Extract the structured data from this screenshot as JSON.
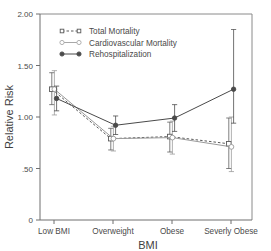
{
  "chart_data": {
    "type": "line",
    "title": "",
    "xlabel": "BMI",
    "ylabel": "Relative Risk",
    "categories": [
      "Low BMI",
      "Overweight",
      "Obese",
      "Severly Obese"
    ],
    "ylim": [
      0,
      2.0
    ],
    "yticks": [
      0,
      0.5,
      1.0,
      1.5,
      2.0
    ],
    "ytick_labels": [
      "0",
      ".50",
      "1.00",
      "1.50",
      "2.00"
    ],
    "grid": false,
    "legend_position": "top-left-inside",
    "series": [
      {
        "name": "Total Mortality",
        "values": [
          1.27,
          0.79,
          0.81,
          0.74
        ],
        "ci_low": [
          1.12,
          0.68,
          0.66,
          0.5
        ],
        "ci_high": [
          1.43,
          0.89,
          0.95,
          0.99
        ],
        "line_style": "dashed",
        "marker": "open-square",
        "color": "#5a5a5a"
      },
      {
        "name": "Cardiovascular Mortality",
        "values": [
          1.27,
          0.79,
          0.8,
          0.71
        ],
        "ci_low": [
          1.02,
          0.67,
          0.64,
          0.47
        ],
        "ci_high": [
          1.45,
          0.91,
          0.96,
          1.0
        ],
        "line_style": "solid",
        "marker": "open-circle",
        "color": "#9a9a9a"
      },
      {
        "name": "Rehospitalization",
        "values": [
          1.18,
          0.92,
          0.99,
          1.27
        ],
        "ci_low": [
          1.06,
          0.83,
          0.86,
          0.94
        ],
        "ci_high": [
          1.3,
          1.01,
          1.12,
          1.85
        ],
        "line_style": "solid",
        "marker": "filled-circle",
        "color": "#4a4a4a"
      }
    ]
  },
  "axes": {
    "y_title": "Relative Risk",
    "x_title": "BMI",
    "y_tick_0": "0",
    "y_tick_1": ".50",
    "y_tick_2": "1.00",
    "y_tick_3": "1.50",
    "y_tick_4": "2.00",
    "x_cat_0": "Low BMI",
    "x_cat_1": "Overweight",
    "x_cat_2": "Obese",
    "x_cat_3": "Severly Obese"
  },
  "legend": {
    "entry_0": "Total Mortality",
    "entry_1": "Cardiovascular Mortality",
    "entry_2": "Rehospitalization"
  },
  "colors": {
    "frame": "#6f6f6f",
    "total_mortality": "#5a5a5a",
    "cardiovascular_mortality": "#9a9a9a",
    "rehospitalization": "#4a4a4a",
    "background": "#ffffff"
  }
}
